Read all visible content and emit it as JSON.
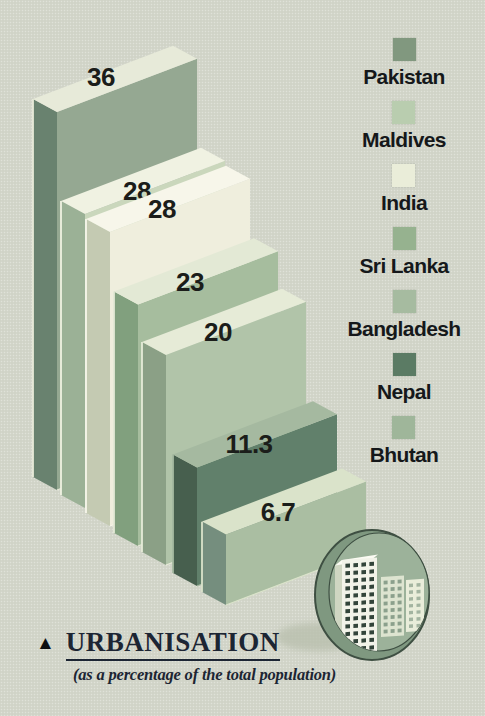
{
  "chart_data": {
    "type": "bar",
    "style": "3d-staircase",
    "title": "URBANISATION",
    "subtitle": "(as a percentage of the total population)",
    "categories": [
      "Pakistan",
      "Maldives",
      "India",
      "Sri Lanka",
      "Bangladesh",
      "Nepal",
      "Bhutan"
    ],
    "values": [
      36,
      28,
      28,
      23,
      20,
      11.3,
      6.7
    ],
    "value_labels": [
      "36",
      "28",
      "28",
      "23",
      "20",
      "11.3",
      "6.7"
    ],
    "unit": "percent of total population",
    "legend_position": "right",
    "axes": "none",
    "grid": false,
    "bar_colors": [
      {
        "front": "#95a892",
        "side": "#69826f",
        "top": "#e7ead9"
      },
      {
        "front": "#cad7bc",
        "side": "#9bb196",
        "top": "#f0f2e2"
      },
      {
        "front": "#efeedd",
        "side": "#c4cab2",
        "top": "#f7f6ea"
      },
      {
        "front": "#a6bd9e",
        "side": "#81a07e",
        "top": "#e3e9d5"
      },
      {
        "front": "#b1c4a9",
        "side": "#8ba086",
        "top": "#e6ebd7"
      },
      {
        "front": "#61806b",
        "side": "#475f4e",
        "top": "#a5b9a0"
      },
      {
        "front": "#aabea2",
        "side": "#758e7e",
        "top": "#dae3ca"
      }
    ]
  },
  "legend": {
    "items": [
      {
        "label": "Pakistan",
        "swatch": "#81987f"
      },
      {
        "label": "Maldives",
        "swatch": "#b9cdaf"
      },
      {
        "label": "India",
        "swatch": "#eaedd9"
      },
      {
        "label": "Sri Lanka",
        "swatch": "#96b28f"
      },
      {
        "label": "Bangladesh",
        "swatch": "#a6bba0"
      },
      {
        "label": "Nepal",
        "swatch": "#5b7b64"
      },
      {
        "label": "Bhutan",
        "swatch": "#9fb69a"
      }
    ]
  },
  "title_block": {
    "marker": "▲",
    "title": "URBANISATION",
    "subtitle": "(as a percentage of the total population)"
  },
  "icon": {
    "name": "urbanisation-buildings-icon",
    "disc_rim": "#7f9880",
    "disc_face": "#9cb29a",
    "outline": "#3e4f42",
    "building_main": "#f2f3e9",
    "building_window": "#32443a",
    "shadow": "#b9c0ae"
  },
  "colors": {
    "background": "#d3d6ca",
    "value_text": "#1b1d1a",
    "legend_text": "#15181a",
    "title_text": "#1c2533"
  }
}
